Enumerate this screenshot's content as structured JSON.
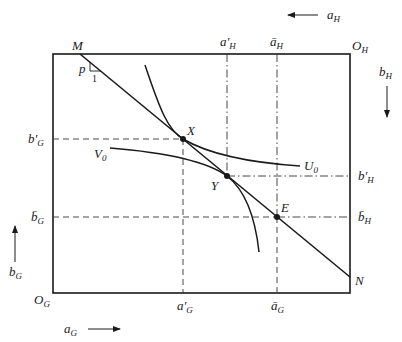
{
  "diagram": {
    "type": "edgeworth-box",
    "box": {
      "x0": 53,
      "y0": 54,
      "x1": 350,
      "y1": 293
    },
    "colors": {
      "stroke": "#1a1a1a",
      "background": "#ffffff"
    },
    "origins": {
      "G": {
        "main": "O",
        "sub": "G"
      },
      "H": {
        "main": "O",
        "sub": "H"
      }
    },
    "axis_labels": {
      "a_G": {
        "main": "a",
        "sub": "G"
      },
      "b_G": {
        "main": "b",
        "sub": "G"
      },
      "a_H": {
        "main": "a",
        "sub": "H"
      },
      "b_H": {
        "main": "b",
        "sub": "H"
      }
    },
    "budget_line": {
      "start_label": "M",
      "end_label": "N",
      "slope_label": "p",
      "slope_run_label": "1"
    },
    "points": {
      "X": "X",
      "Y": "Y",
      "E": "E"
    },
    "curves": {
      "U0": {
        "main": "U",
        "sub": "0"
      },
      "V0": {
        "main": "V",
        "sub": "0"
      }
    },
    "ticks": {
      "a_prime_H": {
        "main": "a",
        "prime": "′",
        "sub": "H"
      },
      "a_bar_H": {
        "main": "ā",
        "sub": "H"
      },
      "b_prime_G": {
        "main": "b",
        "prime": "′",
        "sub": "G"
      },
      "b_bar_G": {
        "main": "b̄",
        "sub": "G"
      },
      "b_prime_H": {
        "main": "b",
        "prime": "′",
        "sub": "H"
      },
      "b_bar_H": {
        "main": "b̄",
        "sub": "H"
      },
      "a_prime_G": {
        "main": "a",
        "prime": "′",
        "sub": "G"
      },
      "a_bar_G": {
        "main": "ā",
        "sub": "G"
      }
    }
  }
}
